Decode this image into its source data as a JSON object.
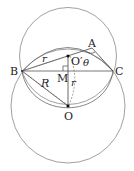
{
  "diagram": {
    "points": {
      "A": "A",
      "B": "B",
      "C": "C",
      "O": "O",
      "O_prime": "O′",
      "M": "M"
    },
    "labels": {
      "r_upper": "r",
      "r_lower": "r",
      "R": "R",
      "theta": "θ"
    }
  }
}
